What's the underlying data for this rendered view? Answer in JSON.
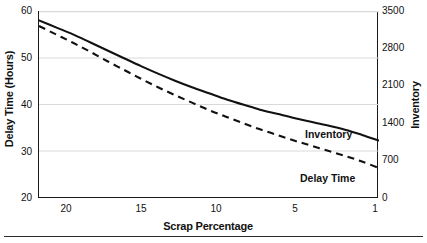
{
  "chart_data": {
    "type": "line",
    "title": "",
    "subtitle": "",
    "xlabel": "Scrap Percentage",
    "ylabel": "Delay Time (Hours)",
    "ylabel_right": "Inventory",
    "xlim": [
      21,
      1
    ],
    "x_inverted": true,
    "xticks": [
      20,
      15,
      10,
      5,
      1
    ],
    "xtick_labels": [
      "20",
      "15",
      "10",
      "5",
      "1"
    ],
    "ylim": [
      20,
      60
    ],
    "yticks": [
      20,
      30,
      40,
      50,
      60
    ],
    "ytick_labels": [
      "20",
      "30",
      "40",
      "50",
      "60"
    ],
    "ylim_right": [
      0,
      3500
    ],
    "yticks_right": [
      0,
      700,
      1400,
      2100,
      2800,
      3500
    ],
    "ytick_labels_right": [
      "0",
      "700",
      "1400",
      "2100",
      "2800",
      "3500"
    ],
    "grid": true,
    "grid_axis": "y",
    "grid_color": "#d9d9d9",
    "legend": "inline-annotations",
    "legend_position": "right-of-curve-ends",
    "x": [
      21,
      20,
      19,
      18,
      17,
      16,
      15,
      14,
      13,
      12,
      11,
      10,
      9,
      8,
      7,
      6,
      5,
      4,
      3,
      2,
      1
    ],
    "series": [
      {
        "name": "Inventory",
        "style": "solid",
        "color": "#111111",
        "axis": "right",
        "values_right_axis": [
          3330,
          3100,
          2890,
          2680,
          2480,
          2290,
          2110,
          1950,
          1800,
          1670,
          1550,
          1450,
          1360,
          1285,
          1220,
          1165,
          1120,
          1080,
          1050,
          1025,
          1010
        ],
        "values_left_scale": [
          58.0,
          56.5,
          55.0,
          53.3,
          51.6,
          49.9,
          48.2,
          46.6,
          45.1,
          43.7,
          42.4,
          41.1,
          40.0,
          38.9,
          38.0,
          37.1,
          36.3,
          35.5,
          34.6,
          33.5,
          32.3
        ]
      },
      {
        "name": "Delay Time",
        "style": "dashed",
        "color": "#111111",
        "axis": "left",
        "values": [
          56.8,
          55.0,
          53.2,
          51.3,
          49.3,
          47.4,
          45.5,
          43.7,
          42.0,
          40.4,
          38.8,
          37.4,
          36.0,
          34.7,
          33.5,
          32.3,
          31.2,
          30.1,
          29.0,
          27.8,
          26.4
        ]
      }
    ],
    "annotations": [
      {
        "text": "Inventory",
        "series": "Inventory"
      },
      {
        "text": "Delay Time",
        "series": "Delay Time"
      }
    ]
  },
  "axes": {
    "left_title": "Delay Time (Hours)",
    "right_title": "Inventory",
    "x_title": "Scrap Percentage"
  },
  "labels": {
    "inventory": "Inventory",
    "delay_time": "Delay Time"
  },
  "ticks": {
    "left": [
      "60",
      "50",
      "40",
      "30",
      "20"
    ],
    "right": [
      "3500",
      "2800",
      "2100",
      "1400",
      "700",
      "0"
    ],
    "bottom": [
      "20",
      "15",
      "10",
      "5",
      "1"
    ]
  }
}
